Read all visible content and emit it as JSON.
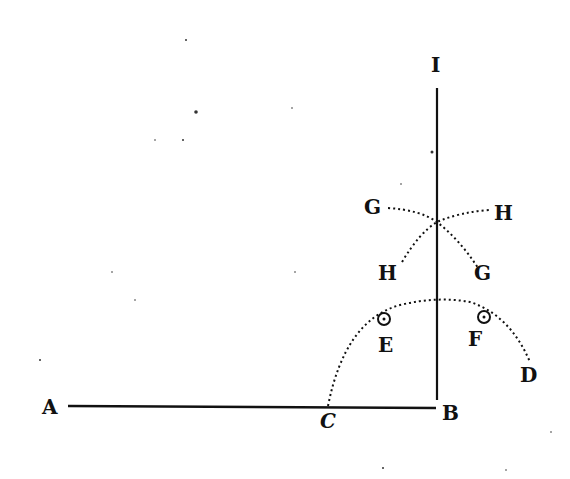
{
  "diagram": {
    "type": "geometric-construction",
    "colors": {
      "ink": "#111111",
      "paper": "#ffffff"
    },
    "labels": {
      "A": "A",
      "B": "B",
      "C": "C",
      "D": "D",
      "E": "E",
      "F": "F",
      "G_left": "G",
      "H_right": "H",
      "H_left": "H",
      "G_right": "G",
      "I": "I"
    },
    "lines": [
      {
        "name": "base-line-AB",
        "from": "A",
        "to": "B",
        "style": "solid"
      },
      {
        "name": "perpendicular-BI",
        "from": "B",
        "to": "I",
        "style": "solid"
      }
    ],
    "arcs": [
      {
        "name": "arc-C-to-D",
        "through": [
          "C",
          "E",
          "F",
          "D"
        ],
        "style": "dotted"
      },
      {
        "name": "arc-G-to-G",
        "through": [
          "G",
          "G"
        ],
        "style": "dotted"
      },
      {
        "name": "arc-H-to-H",
        "through": [
          "H",
          "H"
        ],
        "style": "dotted"
      }
    ],
    "points_marked": [
      "E",
      "F"
    ]
  }
}
